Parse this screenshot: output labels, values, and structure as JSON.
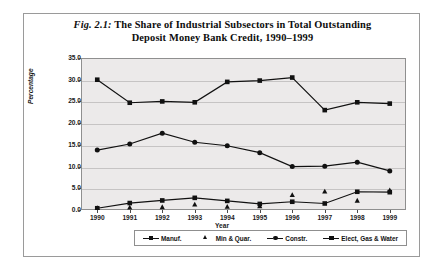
{
  "figure": {
    "number": "Fig. 2.1:",
    "title_line1": "The Share of Industrial Subsectors in Total Outstanding",
    "title_line2": "Deposit Money Bank Credit, 1990–1999"
  },
  "chart_data": {
    "type": "line",
    "xlabel": "Year",
    "ylabel": "Percentage",
    "categories": [
      "1990",
      "1991",
      "1992",
      "1993",
      "1994",
      "1995",
      "1996",
      "1997",
      "1998",
      "1999"
    ],
    "ylim": [
      0.0,
      35.0
    ],
    "ytick_labels": [
      "0.0",
      "5.0",
      "10.0",
      "15.0",
      "20.0",
      "25.0",
      "30.0",
      "35.0"
    ],
    "ytick_values": [
      0.0,
      5.0,
      10.0,
      15.0,
      20.0,
      25.0,
      30.0,
      35.0
    ],
    "grid": true,
    "legend_position": "bottom",
    "series": [
      {
        "name": "Manuf.",
        "marker": "square",
        "line": true,
        "values": [
          30.0,
          24.7,
          25.0,
          24.8,
          29.5,
          29.8,
          30.5,
          23.0,
          24.8,
          24.5
        ]
      },
      {
        "name": "Min & Quar.",
        "marker": "triangle",
        "line": false,
        "values": [
          0.5,
          0.6,
          0.7,
          1.3,
          0.8,
          0.9,
          3.5,
          4.3,
          2.2,
          4.6
        ]
      },
      {
        "name": "Constr.",
        "marker": "circle",
        "line": true,
        "values": [
          13.8,
          15.2,
          17.7,
          15.6,
          14.8,
          13.2,
          10.0,
          10.1,
          11.0,
          9.0
        ]
      },
      {
        "name": "Elect, Gas & Water",
        "marker": "square",
        "line": true,
        "values": [
          0.4,
          1.6,
          2.2,
          2.8,
          2.1,
          1.4,
          1.9,
          1.5,
          4.2,
          4.1
        ]
      }
    ]
  }
}
